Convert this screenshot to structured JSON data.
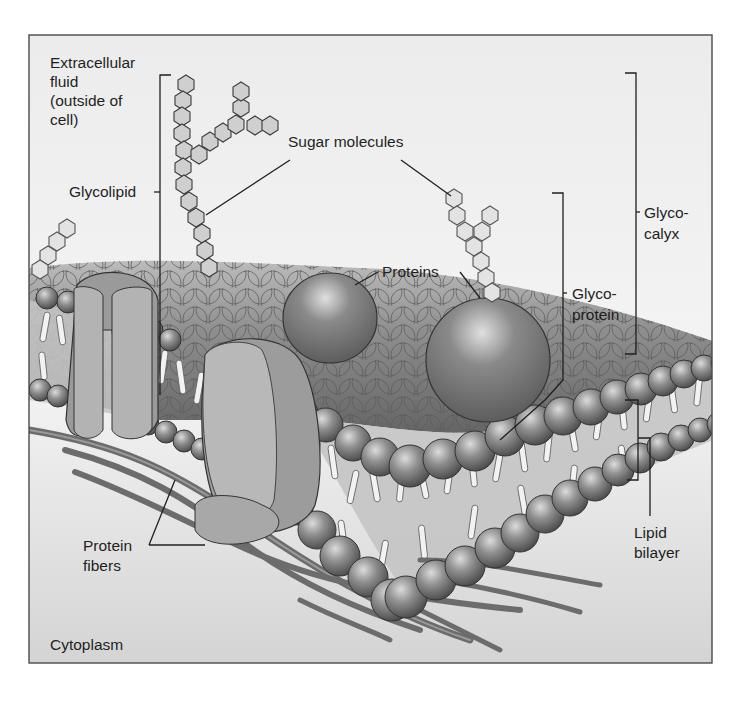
{
  "figure": {
    "colors": {
      "background": "#ffffff",
      "panel_top": "#ececec",
      "panel_bottom": "#d6d6d6",
      "frame": "#4a4a4a",
      "lipid_head": "#8e8e8e",
      "protein": "#7d7d7d",
      "protein_channel": "#a9a9a9",
      "fiber": "#6c6c6c",
      "sugar": "#cfcfcf",
      "text": "#1f1f1f"
    },
    "labels": {
      "extracellular": [
        "Extracellular",
        "fluid",
        "(outside of",
        "cell)"
      ],
      "sugar_molecules": "Sugar molecules",
      "glycolipid": "Glycolipid",
      "glycocalyx": [
        "Glyco-",
        "calyx"
      ],
      "proteins": "Proteins",
      "glycoprotein": [
        "Glyco-",
        "protein"
      ],
      "lipid_bilayer": [
        "Lipid",
        "bilayer"
      ],
      "protein_fibers": [
        "Protein",
        "fibers"
      ],
      "cytoplasm": "Cytoplasm"
    }
  }
}
